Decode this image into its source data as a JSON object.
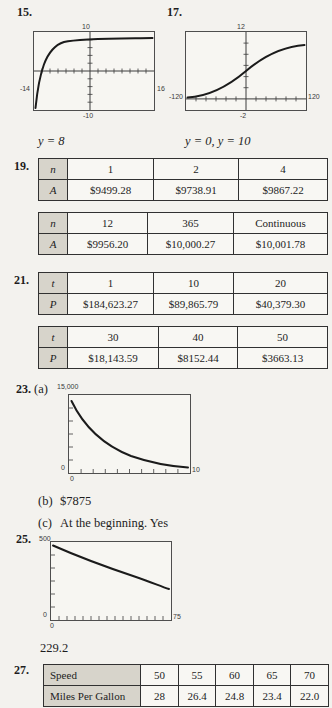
{
  "p15": {
    "number": "15.",
    "graph": {
      "ymax": "10",
      "xmin": "-14",
      "xmax": "16",
      "ymin": "-10"
    },
    "answer": "y = 8"
  },
  "p17": {
    "number": "17.",
    "graph": {
      "ymax": "12",
      "xmin": "-120",
      "xmax": "120",
      "ymin": "-2"
    },
    "answer": "y = 0, y = 10"
  },
  "p19": {
    "number": "19.",
    "table1": {
      "rows": [
        [
          "n",
          "1",
          "2",
          "4"
        ],
        [
          "A",
          "$9499.28",
          "$9738.91",
          "$9867.22"
        ]
      ]
    },
    "table2": {
      "rows": [
        [
          "n",
          "12",
          "365",
          "Continuous"
        ],
        [
          "A",
          "$9956.20",
          "$10,000.27",
          "$10,001.78"
        ]
      ]
    }
  },
  "p21": {
    "number": "21.",
    "table1": {
      "rows": [
        [
          "t",
          "1",
          "10",
          "20"
        ],
        [
          "P",
          "$184,623.27",
          "$89,865.79",
          "$40,379.30"
        ]
      ]
    },
    "table2": {
      "rows": [
        [
          "t",
          "30",
          "40",
          "50"
        ],
        [
          "P",
          "$18,143.59",
          "$8152.44",
          "$3663.13"
        ]
      ]
    }
  },
  "p23": {
    "number": "23.",
    "part_a_label": "(a)",
    "graph": {
      "ymax": "15,000",
      "y_origin": "0",
      "xmax": "10",
      "x_origin": "0"
    },
    "part_b_label": "(b)",
    "part_b_answer": "$7875",
    "part_c_label": "(c)",
    "part_c_answer": "At the beginning. Yes"
  },
  "p25": {
    "number": "25.",
    "graph": {
      "ymax": "500",
      "y_origin": "0",
      "xmax": "75",
      "x_origin": "0"
    },
    "answer": "229.2"
  },
  "p27": {
    "number": "27.",
    "table": {
      "rows": [
        [
          "Speed",
          "50",
          "55",
          "60",
          "65",
          "70"
        ],
        [
          "Miles Per Gallon",
          "28",
          "26.4",
          "24.8",
          "23.4",
          "22.0"
        ]
      ]
    }
  }
}
